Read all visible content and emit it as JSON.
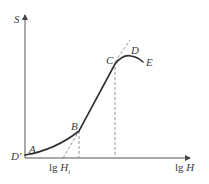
{
  "diagram": {
    "y_axis_label": "S",
    "x_axis_label_prefix": "lg",
    "x_axis_label_var": "H",
    "tick_label_prefix": "lg",
    "tick_label_var": "H",
    "tick_label_sub": "i",
    "points": {
      "D_prime": "D'",
      "A": "A",
      "B": "B",
      "C": "C",
      "D": "D",
      "E": "E"
    },
    "colors": {
      "curve": "#2e2e2e",
      "axis": "#555555",
      "dashed": "#888888",
      "text": "#3a3a3a"
    }
  }
}
